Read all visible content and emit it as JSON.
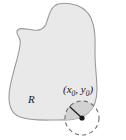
{
  "figure": {
    "type": "diagram",
    "background_color": "#ffffff",
    "region": {
      "label": "R",
      "fill_color": "#e9e9e9",
      "stroke_color": "#9a9a9a",
      "label_x": 28,
      "label_y": 103
    },
    "point": {
      "label_open_paren": "(",
      "label_x_var": "x",
      "label_x_sub": "0",
      "label_comma": ", ",
      "label_y_var": "y",
      "label_y_sub": "0",
      "label_close_paren": ")",
      "full_label": "(x0, y0)",
      "dot_color": "#1a1a1a",
      "center_x": 82,
      "center_y": 118,
      "label_x": 63,
      "label_y": 93
    },
    "neighborhood": {
      "style": "dashed",
      "stroke_color": "#6e6e6e",
      "inside_fill_color": "#d6d6d6",
      "radius": 17,
      "radius_line_color": "#1a1a1a"
    }
  }
}
